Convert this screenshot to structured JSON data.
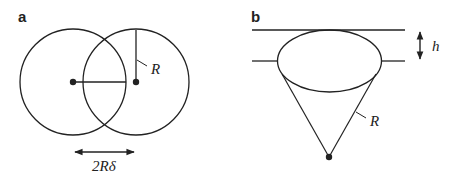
{
  "panels": [
    {
      "id": "a",
      "label": "a",
      "description": "Two overlapping circles of radius R whose centers are separated by 2Rδ",
      "radius_label": "R",
      "separation_label": "2Rδ"
    },
    {
      "id": "b",
      "label": "b",
      "description": "Spherical cap / cone of slant radius R between two parallel planes separated by h",
      "height_label": "h",
      "radius_label": "R"
    }
  ],
  "colors": {
    "stroke": "#222222",
    "background": "#ffffff"
  }
}
